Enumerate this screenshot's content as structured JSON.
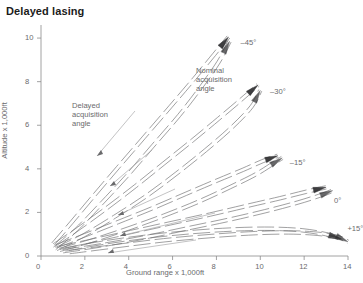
{
  "chart_data": {
    "type": "line",
    "title": "Delayed lasing",
    "xlabel": "Ground range x 1,000ft",
    "ylabel": "Altitude x 1,000ft",
    "xlim": [
      0,
      14
    ],
    "ylim": [
      0,
      10.6
    ],
    "xticks": [
      "0",
      "2",
      "4",
      "6",
      "8",
      "10",
      "12",
      "14"
    ],
    "yticks": [
      "0",
      "2",
      "4",
      "6",
      "8",
      "10"
    ],
    "grid": false,
    "legend_position": "inline-annotations",
    "annotations": [
      {
        "name": "delayed-acquisition-angle",
        "text": "Delayed\nacquisition\nangle",
        "line1": "Delayed",
        "line2": "acquisition",
        "line3": "angle"
      },
      {
        "name": "nominal-acquisition-angle",
        "text": "Nominal\nacquisition\nangle",
        "line1": "Nominal",
        "line2": "acquisition",
        "line3": "angle"
      }
    ],
    "series": [
      {
        "name": "minus-45",
        "label": "–45°",
        "angle_deg": -45,
        "nominal": {
          "x": [
            0.55,
            1.4,
            2.4,
            3.5,
            4.7,
            5.9,
            7.0,
            7.9,
            8.55
          ],
          "y": [
            0.55,
            1.55,
            2.75,
            4.05,
            5.45,
            6.85,
            8.15,
            9.25,
            10.05
          ]
        },
        "delayed": {
          "x": [
            0.62,
            1.6,
            2.7,
            3.9,
            5.1,
            6.3,
            7.3,
            8.1,
            8.6
          ],
          "y": [
            0.35,
            1.2,
            2.35,
            3.65,
            5.05,
            6.45,
            7.75,
            8.9,
            9.85
          ]
        }
      },
      {
        "name": "minus-30",
        "label": "–30°",
        "angle_deg": -30,
        "nominal": {
          "x": [
            0.6,
            1.7,
            3.0,
            4.3,
            5.6,
            6.9,
            8.1,
            9.1,
            9.9
          ],
          "y": [
            0.5,
            1.25,
            2.2,
            3.2,
            4.25,
            5.3,
            6.3,
            7.15,
            7.85
          ]
        },
        "delayed": {
          "x": [
            0.7,
            1.95,
            3.35,
            4.8,
            6.2,
            7.5,
            8.7,
            9.6,
            10.0
          ],
          "y": [
            0.32,
            0.95,
            1.8,
            2.75,
            3.8,
            4.85,
            5.9,
            6.85,
            7.6
          ]
        }
      },
      {
        "name": "minus-15",
        "label": "–15°",
        "angle_deg": -15,
        "nominal": {
          "x": [
            0.7,
            2.0,
            3.5,
            5.1,
            6.6,
            8.0,
            9.2,
            10.1,
            10.8
          ],
          "y": [
            0.45,
            0.95,
            1.55,
            2.2,
            2.85,
            3.45,
            3.95,
            4.35,
            4.6
          ]
        },
        "delayed": {
          "x": [
            0.85,
            2.3,
            3.95,
            5.6,
            7.2,
            8.6,
            9.8,
            10.6,
            11.0
          ],
          "y": [
            0.28,
            0.7,
            1.25,
            1.85,
            2.5,
            3.15,
            3.75,
            4.25,
            4.5
          ]
        }
      },
      {
        "name": "zero",
        "label": "0°",
        "angle_deg": 0,
        "nominal": {
          "x": [
            0.85,
            2.4,
            4.1,
            5.9,
            7.7,
            9.4,
            10.9,
            12.1,
            13.0
          ],
          "y": [
            0.38,
            0.72,
            1.1,
            1.5,
            1.9,
            2.3,
            2.65,
            2.95,
            3.15
          ]
        },
        "delayed": {
          "x": [
            1.0,
            2.8,
            4.7,
            6.6,
            8.5,
            10.2,
            11.7,
            12.8,
            13.3
          ],
          "y": [
            0.22,
            0.5,
            0.85,
            1.25,
            1.65,
            2.05,
            2.45,
            2.8,
            3.0
          ]
        }
      },
      {
        "name": "plus-15",
        "label": "+15°",
        "angle_deg": 15,
        "nominal": {
          "x": [
            1.1,
            2.9,
            4.9,
            6.9,
            8.8,
            10.5,
            11.9,
            13.0,
            13.7
          ],
          "y": [
            0.3,
            0.62,
            0.9,
            1.1,
            1.22,
            1.25,
            1.18,
            1.0,
            0.78
          ]
        },
        "delayed": {
          "x": [
            1.3,
            3.4,
            5.6,
            7.8,
            9.8,
            11.5,
            12.8,
            13.6,
            14.0
          ],
          "y": [
            0.18,
            0.45,
            0.72,
            0.92,
            1.05,
            1.08,
            1.0,
            0.85,
            0.65
          ]
        }
      }
    ],
    "curve_labels": [
      "–45°",
      "–30°",
      "–15°",
      "0°",
      "+15°"
    ],
    "colors": {
      "curve": "#6e6e70",
      "arrowhead": "#2e2e30",
      "axis": "#8a8a8c",
      "text": "#6a6a6c",
      "title": "#1b1b1b"
    }
  }
}
